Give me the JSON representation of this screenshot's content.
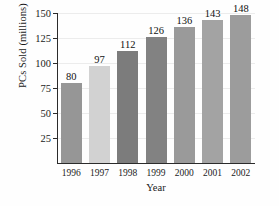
{
  "chart_data": {
    "type": "bar",
    "title": "",
    "categories": [
      "1996",
      "1997",
      "1998",
      "1999",
      "2000",
      "2001",
      "2002"
    ],
    "values": [
      80,
      97,
      112,
      126,
      136,
      143,
      148
    ],
    "value_labels": [
      "80",
      "97",
      "112",
      "126",
      "136",
      "143",
      "148"
    ],
    "xlabel": "Year",
    "ylabel": "PCs Sold (millions)",
    "ylim": [
      0,
      150
    ],
    "yticks": [
      25,
      50,
      75,
      100,
      125,
      150
    ],
    "ytick_labels": [
      "25",
      "50",
      "75",
      "100",
      "125",
      "150"
    ],
    "grid": true,
    "legend": false,
    "bar_colors": [
      "#969696",
      "#d2d2d2",
      "#7c7c7c",
      "#828282",
      "#9a9a9a",
      "#a3a3a3",
      "#9c9c9c"
    ],
    "axis_color": "#2b2b2b",
    "grid_color": "#ececec",
    "background": "#fefefe",
    "bars": [
      {
        "category": "1996",
        "value": 80,
        "label": "80",
        "color": "#969696"
      },
      {
        "category": "1997",
        "value": 97,
        "label": "97",
        "color": "#d2d2d2"
      },
      {
        "category": "1998",
        "value": 112,
        "label": "112",
        "color": "#7c7c7c"
      },
      {
        "category": "1999",
        "value": 126,
        "label": "126",
        "color": "#828282"
      },
      {
        "category": "2000",
        "value": 136,
        "label": "136",
        "color": "#9a9a9a"
      },
      {
        "category": "2001",
        "value": 143,
        "label": "143",
        "color": "#a3a3a3"
      },
      {
        "category": "2002",
        "value": 148,
        "label": "148",
        "color": "#9c9c9c"
      }
    ]
  }
}
